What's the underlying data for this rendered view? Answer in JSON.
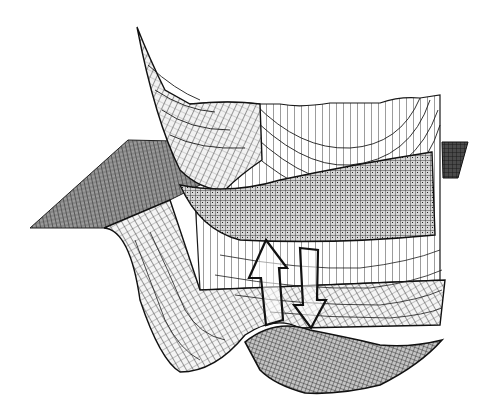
{
  "figure": {
    "type": "wireframe-surface-diagram",
    "colors": {
      "background": "#ffffff",
      "line": "#1a1a1a",
      "plane_fill": "#8a8a8a",
      "dense_mesh_fill": "#b5b5b5",
      "dark_plate": "#3a3a3a"
    },
    "arrows": [
      {
        "direction": "up",
        "icon": "arrow-up-outline-icon"
      },
      {
        "direction": "down",
        "icon": "arrow-down-outline-icon"
      }
    ]
  }
}
